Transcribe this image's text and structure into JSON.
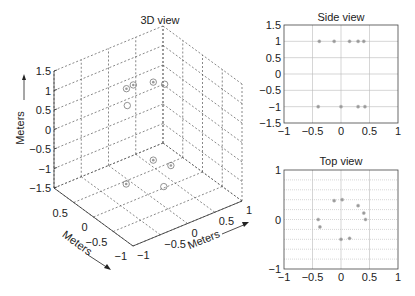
{
  "chart_data": [
    {
      "type": "scatter",
      "title": "3D view",
      "xlabel": "Meters",
      "ylabel": "Meters",
      "zlabel": "Meters",
      "xlim": [
        -1,
        1
      ],
      "ylim": [
        -1,
        1
      ],
      "zlim": [
        -1.5,
        1.5
      ],
      "xticks": [
        "-1",
        "-0.5",
        "0",
        "0.5",
        "1"
      ],
      "yticks": [
        "-1",
        "-0.5",
        "0",
        "0.5"
      ],
      "zticks": [
        "-1.5",
        "-1",
        "-0.5",
        "0",
        "0.5",
        "1",
        "1.5"
      ],
      "grid": true,
      "points": [
        {
          "x": -0.38,
          "y": 0.0,
          "z": 1
        },
        {
          "x": -0.12,
          "y": 0.38,
          "z": 1
        },
        {
          "x": 0.02,
          "y": 0.4,
          "z": 1
        },
        {
          "x": 0.3,
          "y": 0.28,
          "z": 1
        },
        {
          "x": 0.4,
          "y": 0.13,
          "z": 1
        },
        {
          "x": -0.4,
          "y": 0.0,
          "z": -1
        },
        {
          "x": 0.0,
          "y": -0.4,
          "z": -1
        },
        {
          "x": 0.3,
          "y": 0.28,
          "z": -1
        },
        {
          "x": 0.42,
          "y": 0.0,
          "z": -1
        }
      ]
    },
    {
      "type": "scatter",
      "title": "Side view",
      "xlim": [
        -1,
        1
      ],
      "ylim": [
        -1.5,
        1.5
      ],
      "xticks": [
        "-1",
        "-0.5",
        "0",
        "0.5",
        "1"
      ],
      "yticks": [
        "1.5",
        "1",
        "0.5",
        "0",
        "-0.5",
        "-1",
        "-1.5"
      ],
      "grid": true,
      "points": [
        {
          "x": -0.38,
          "y": 1
        },
        {
          "x": -0.12,
          "y": 1
        },
        {
          "x": 0.15,
          "y": 1
        },
        {
          "x": 0.3,
          "y": 1
        },
        {
          "x": 0.4,
          "y": 1
        },
        {
          "x": -0.4,
          "y": -1
        },
        {
          "x": 0.0,
          "y": -1
        },
        {
          "x": 0.3,
          "y": -1
        },
        {
          "x": 0.42,
          "y": -1
        }
      ]
    },
    {
      "type": "scatter",
      "title": "Top view",
      "xlim": [
        -1,
        1
      ],
      "ylim": [
        -1,
        1
      ],
      "xticks": [
        "-1",
        "-0.5",
        "0",
        "0.5",
        "1"
      ],
      "yticks": [
        "1",
        "0",
        "-1"
      ],
      "grid": true,
      "points": [
        {
          "x": -0.12,
          "y": 0.38
        },
        {
          "x": 0.02,
          "y": 0.4
        },
        {
          "x": 0.3,
          "y": 0.28
        },
        {
          "x": 0.4,
          "y": 0.13
        },
        {
          "x": 0.43,
          "y": 0.0
        },
        {
          "x": -0.4,
          "y": 0.0
        },
        {
          "x": -0.37,
          "y": -0.15
        },
        {
          "x": 0.0,
          "y": -0.4
        },
        {
          "x": 0.15,
          "y": -0.38
        }
      ]
    }
  ],
  "labels": {
    "view3d_title": "3D view",
    "side_title": "Side view",
    "top_title": "Top view",
    "axis_unit": "Meters"
  }
}
